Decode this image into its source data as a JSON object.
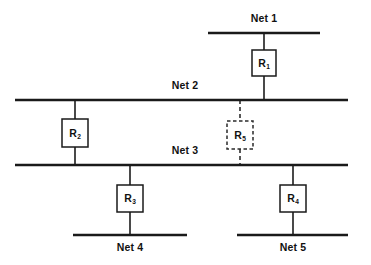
{
  "diagram": {
    "type": "network-topology",
    "title": "",
    "background_color": "#ffffff",
    "line_color": "#1a1a1a",
    "networks": [
      {
        "id": "net1",
        "label": "Net 1",
        "label_position": "above",
        "x1": 208,
        "x2": 320,
        "y": 33,
        "label_x": 264,
        "label_y": 13
      },
      {
        "id": "net2",
        "label": "Net 2",
        "label_position": "above",
        "x1": 15,
        "x2": 348,
        "y": 100,
        "label_x": 185,
        "label_y": 80
      },
      {
        "id": "net3",
        "label": "Net 3",
        "label_position": "above",
        "x1": 15,
        "x2": 348,
        "y": 165,
        "label_x": 185,
        "label_y": 145
      },
      {
        "id": "net4",
        "label": "Net 4",
        "label_position": "below",
        "x1": 73,
        "x2": 187,
        "y": 235,
        "label_x": 130,
        "label_y": 242
      },
      {
        "id": "net5",
        "label": "Net 5",
        "label_position": "below",
        "x1": 237,
        "x2": 348,
        "y": 235,
        "label_x": 293,
        "label_y": 242
      }
    ],
    "routers": [
      {
        "id": "r1",
        "label": "R",
        "subscript": "1",
        "style": "solid",
        "connects": [
          "net1",
          "net2"
        ],
        "x": 264,
        "y": 63,
        "box_x": 252,
        "box_y": 50,
        "box_w": 24,
        "box_h": 26,
        "link_x": 264,
        "link_y1": 33,
        "link_y2": 100
      },
      {
        "id": "r2",
        "label": "R",
        "subscript": "2",
        "style": "solid",
        "connects": [
          "net2",
          "net3"
        ],
        "x": 75,
        "y": 133,
        "box_x": 62,
        "box_y": 119,
        "box_w": 26,
        "box_h": 28,
        "link_x": 75,
        "link_y1": 100,
        "link_y2": 165
      },
      {
        "id": "r5",
        "label": "R",
        "subscript": "5",
        "style": "dashed",
        "connects": [
          "net2",
          "net3"
        ],
        "x": 240,
        "y": 135,
        "box_x": 227,
        "box_y": 121,
        "box_w": 26,
        "box_h": 28,
        "link_x": 240,
        "link_y1": 100,
        "link_y2": 165
      },
      {
        "id": "r3",
        "label": "R",
        "subscript": "3",
        "style": "solid",
        "connects": [
          "net3",
          "net4"
        ],
        "x": 130,
        "y": 198,
        "box_x": 117,
        "box_y": 185,
        "box_w": 26,
        "box_h": 27,
        "link_x": 130,
        "link_y1": 165,
        "link_y2": 235
      },
      {
        "id": "r4",
        "label": "R",
        "subscript": "4",
        "style": "solid",
        "connects": [
          "net3",
          "net5"
        ],
        "x": 293,
        "y": 198,
        "box_x": 280,
        "box_y": 185,
        "box_w": 26,
        "box_h": 27,
        "link_x": 293,
        "link_y1": 165,
        "link_y2": 235
      }
    ]
  },
  "labels": {
    "net1": "Net 1",
    "net2": "Net 2",
    "net3": "Net 3",
    "net4": "Net 4",
    "net5": "Net 5",
    "r1_base": "R",
    "r1_sub": "1",
    "r2_base": "R",
    "r2_sub": "2",
    "r3_base": "R",
    "r3_sub": "3",
    "r4_base": "R",
    "r4_sub": "4",
    "r5_base": "R",
    "r5_sub": "5"
  }
}
